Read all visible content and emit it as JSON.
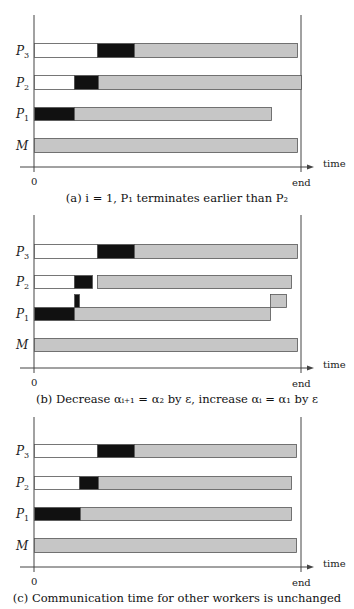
{
  "colors": {
    "idle": "#ffffff",
    "communication": "#111111",
    "computation": "#c6c6c6",
    "border": "#555555",
    "axis": "#444444"
  },
  "axis": {
    "x0_label": "0",
    "end_label": "end",
    "time_label": "time"
  },
  "panels": [
    {
      "id": "a",
      "caption": "(a) i = 1, P₁ terminates earlier than P₂",
      "top": 15,
      "axis_y": 167,
      "rows": [
        {
          "label": "P",
          "sub": "3",
          "y": 43,
          "h": 14,
          "segments": [
            {
              "type": "idle",
              "x0": 34,
              "x1": 97
            },
            {
              "type": "communication",
              "x0": 97,
              "x1": 134
            },
            {
              "type": "computation",
              "x0": 134,
              "x1": 297
            }
          ]
        },
        {
          "label": "P",
          "sub": "2",
          "y": 75,
          "h": 14,
          "segments": [
            {
              "type": "idle",
              "x0": 34,
              "x1": 74
            },
            {
              "type": "communication",
              "x0": 74,
              "x1": 98
            },
            {
              "type": "computation",
              "x0": 98,
              "x1": 301
            }
          ]
        },
        {
          "label": "P",
          "sub": "1",
          "y": 107,
          "h": 13,
          "segments": [
            {
              "type": "communication",
              "x0": 34,
              "x1": 74
            },
            {
              "type": "computation",
              "x0": 74,
              "x1": 271
            }
          ]
        },
        {
          "label": "M",
          "sub": "",
          "y": 138,
          "h": 14,
          "segments": [
            {
              "type": "computation",
              "x0": 34,
              "x1": 297
            }
          ]
        }
      ],
      "extras": []
    },
    {
      "id": "b",
      "caption": "(b) Decrease αᵢ₊₁ = α₂ by ε, increase αᵢ = α₁ by ε",
      "top": 215,
      "axis_y": 368,
      "rows": [
        {
          "label": "P",
          "sub": "3",
          "y": 244,
          "h": 14,
          "segments": [
            {
              "type": "idle",
              "x0": 34,
              "x1": 97
            },
            {
              "type": "communication",
              "x0": 97,
              "x1": 134
            },
            {
              "type": "computation",
              "x0": 134,
              "x1": 297
            }
          ]
        },
        {
          "label": "P",
          "sub": "2",
          "y": 275,
          "h": 13,
          "segments": [
            {
              "type": "idle",
              "x0": 34,
              "x1": 74
            },
            {
              "type": "communication",
              "x0": 74,
              "x1": 92
            },
            {
              "type": "computation",
              "x0": 97,
              "x1": 291
            }
          ]
        },
        {
          "label": "P",
          "sub": "1",
          "y": 307,
          "h": 13,
          "segments": [
            {
              "type": "communication",
              "x0": 34,
              "x1": 74
            },
            {
              "type": "computation",
              "x0": 74,
              "x1": 270
            }
          ]
        },
        {
          "label": "M",
          "sub": "",
          "y": 338,
          "h": 13,
          "segments": [
            {
              "type": "computation",
              "x0": 34,
              "x1": 297
            }
          ]
        }
      ],
      "extras": [
        {
          "name": "epsilon-communication-piece",
          "type": "communication",
          "x0": 74,
          "x1": 79,
          "y": 294,
          "h": 13
        },
        {
          "name": "epsilon-computation-piece",
          "type": "computation",
          "x0": 270,
          "x1": 286,
          "y": 294,
          "h": 13
        }
      ]
    },
    {
      "id": "c",
      "caption": "(c) Communication time for other workers is unchanged",
      "top": 417,
      "axis_y": 567,
      "rows": [
        {
          "label": "P",
          "sub": "3",
          "y": 444,
          "h": 13,
          "segments": [
            {
              "type": "idle",
              "x0": 34,
              "x1": 97
            },
            {
              "type": "communication",
              "x0": 97,
              "x1": 134
            },
            {
              "type": "computation",
              "x0": 134,
              "x1": 296
            }
          ]
        },
        {
          "label": "P",
          "sub": "2",
          "y": 476,
          "h": 13,
          "segments": [
            {
              "type": "idle",
              "x0": 34,
              "x1": 79
            },
            {
              "type": "communication",
              "x0": 79,
              "x1": 98
            },
            {
              "type": "computation",
              "x0": 98,
              "x1": 291
            }
          ]
        },
        {
          "label": "P",
          "sub": "1",
          "y": 507,
          "h": 13,
          "segments": [
            {
              "type": "communication",
              "x0": 34,
              "x1": 80
            },
            {
              "type": "computation",
              "x0": 80,
              "x1": 291
            }
          ]
        },
        {
          "label": "M",
          "sub": "",
          "y": 538,
          "h": 14,
          "segments": [
            {
              "type": "computation",
              "x0": 34,
              "x1": 296
            }
          ]
        }
      ],
      "extras": []
    }
  ],
  "layout": {
    "x_origin": 34,
    "x_end": 301,
    "arrow_left": 20,
    "arrow_right": 314
  }
}
